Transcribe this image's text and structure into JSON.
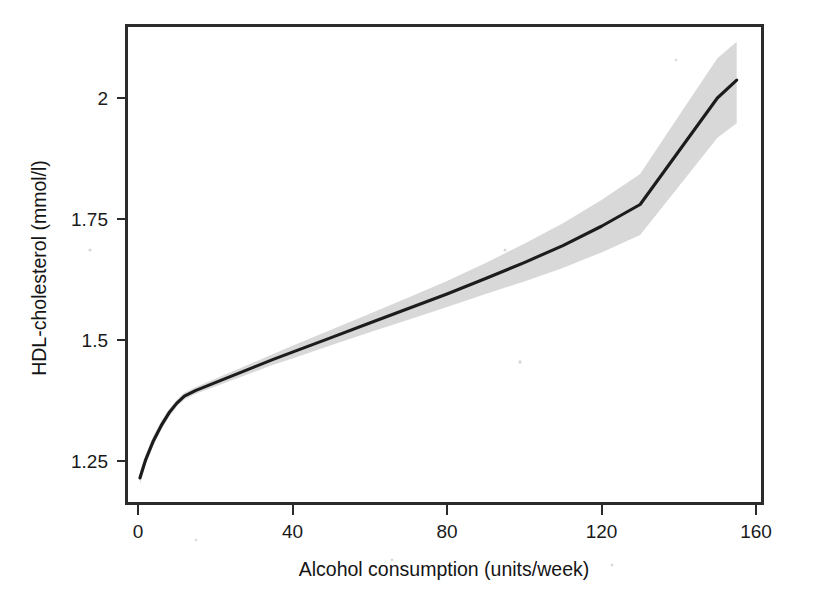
{
  "figure": {
    "background_color": "#ffffff",
    "line_color": "#1c1c1c",
    "band_color": "#c9c9c9",
    "axis_color": "#2b2b2b"
  },
  "chart_data": {
    "type": "line",
    "title": "",
    "subtitle": "",
    "xlabel": "Alcohol consumption (units/week)",
    "ylabel": "HDL-cholesterol (mmol/l)",
    "xlim": [
      -4,
      164
    ],
    "ylim": [
      1.175,
      2.135
    ],
    "xticks": [
      0,
      40,
      80,
      120,
      160
    ],
    "xtick_labels": [
      "0",
      "40",
      "80",
      "120",
      "160"
    ],
    "yticks": [
      1.25,
      1.5,
      1.75,
      2
    ],
    "ytick_labels": [
      "1.25",
      "1.5",
      "1.75",
      "2"
    ],
    "grid": false,
    "legend": null,
    "legend_position": "none",
    "annotations": [],
    "series": [
      {
        "name": "Fitted HDL-cholesterol",
        "kind": "line",
        "x": [
          0.5,
          2,
          4,
          6,
          8,
          10,
          12,
          15,
          20,
          25,
          30,
          35,
          40,
          50,
          60,
          70,
          80,
          90,
          100,
          110,
          120,
          130,
          140,
          150,
          155
        ],
        "values": [
          1.215,
          1.253,
          1.292,
          1.323,
          1.349,
          1.369,
          1.384,
          1.396,
          1.412,
          1.428,
          1.444,
          1.46,
          1.475,
          1.505,
          1.535,
          1.565,
          1.595,
          1.627,
          1.66,
          1.695,
          1.735,
          1.78,
          1.89,
          2.0,
          2.037
        ]
      },
      {
        "name": "95% confidence band (upper)",
        "kind": "band_upper",
        "x": [
          0.5,
          2,
          4,
          6,
          8,
          10,
          12,
          15,
          20,
          25,
          30,
          35,
          40,
          50,
          60,
          70,
          80,
          90,
          100,
          110,
          120,
          130,
          140,
          150,
          155
        ],
        "values": [
          1.228,
          1.264,
          1.302,
          1.332,
          1.357,
          1.376,
          1.391,
          1.403,
          1.42,
          1.437,
          1.454,
          1.471,
          1.488,
          1.521,
          1.554,
          1.588,
          1.622,
          1.659,
          1.699,
          1.741,
          1.789,
          1.843,
          1.963,
          2.082,
          2.116
        ]
      },
      {
        "name": "95% confidence band (lower)",
        "kind": "band_lower",
        "x": [
          0.5,
          2,
          4,
          6,
          8,
          10,
          12,
          15,
          20,
          25,
          30,
          35,
          40,
          50,
          60,
          70,
          80,
          90,
          100,
          110,
          120,
          130,
          140,
          150,
          155
        ],
        "values": [
          1.202,
          1.242,
          1.282,
          1.314,
          1.341,
          1.362,
          1.377,
          1.389,
          1.404,
          1.419,
          1.434,
          1.449,
          1.462,
          1.489,
          1.516,
          1.542,
          1.568,
          1.595,
          1.621,
          1.649,
          1.681,
          1.717,
          1.817,
          1.918,
          1.948
        ]
      }
    ]
  },
  "axis_titles": {
    "x": "Alcohol consumption (units/week)",
    "y": "HDL-cholesterol (mmol/l)"
  }
}
